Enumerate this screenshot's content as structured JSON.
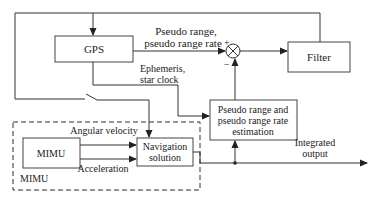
{
  "diagram": {
    "type": "block-diagram",
    "colors": {
      "line": "#333333",
      "box_border": "#444444",
      "background": "#ffffff",
      "text": "#222222"
    },
    "blocks": {
      "gps": {
        "label": "GPS"
      },
      "filter": {
        "label": "Filter"
      },
      "estimation": {
        "line1": "Pseudo range and",
        "line2": "pseudo range rate",
        "line3": "estimation"
      },
      "mimu_inner": {
        "label": "MIMU"
      },
      "nav_solution": {
        "line1": "Navigation",
        "line2": "solution"
      },
      "mimu_group": {
        "label": "MIMU"
      }
    },
    "signals": {
      "pseudo_range": {
        "line1": "Pseudo range,",
        "line2": "pseudo range rate"
      },
      "plus_sign": "+",
      "minus_sign": "−",
      "ephemeris": {
        "line1": "Ephemeris,",
        "line2": "star clock"
      },
      "angular_velocity": "Angular velocity",
      "acceleration": "Acceleration",
      "integrated_output": {
        "line1": "Integrated",
        "line2": "output"
      }
    },
    "components": [
      "summing-junction",
      "switch",
      "junction-dot"
    ]
  }
}
